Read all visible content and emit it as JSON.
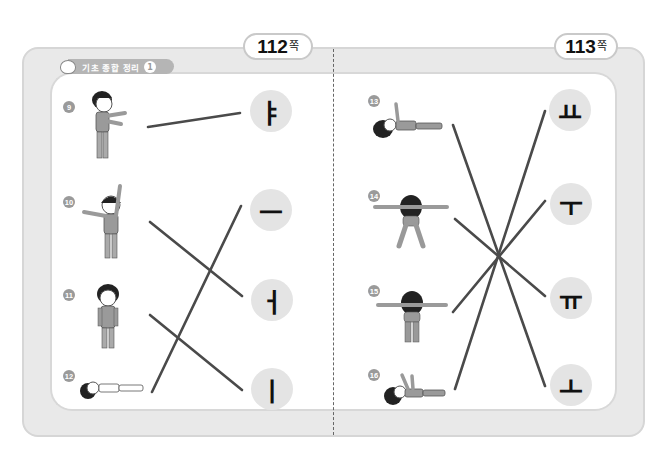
{
  "pages": {
    "left_page": "112",
    "right_page": "113",
    "unit": "쪽"
  },
  "section": {
    "title": "기초 종합 정리",
    "badge": "1"
  },
  "colors": {
    "frame": "#e9e9e9",
    "circle": "#e4e4e4",
    "line": "#4a4a4a",
    "qnum": "#9a9a9a"
  },
  "left": {
    "questions": [
      {
        "num": "9",
        "pose": "standing, both arms stretched forward"
      },
      {
        "num": "10",
        "pose": "standing, one arm up, one arm out to side"
      },
      {
        "num": "11",
        "pose": "standing straight, arms down"
      },
      {
        "num": "12",
        "pose": "lying flat on back"
      }
    ],
    "vowels": [
      "ㅑ",
      "ㅡ",
      "ㅓ",
      "ㅣ"
    ],
    "matches": [
      {
        "question": "9",
        "vowel": "ㅑ"
      },
      {
        "question": "10",
        "vowel": "ㅓ"
      },
      {
        "question": "11",
        "vowel": "ㅣ"
      },
      {
        "question": "12",
        "vowel": "ㅡ"
      }
    ]
  },
  "right": {
    "questions": [
      {
        "num": "13",
        "pose": "lying, one arm raised up"
      },
      {
        "num": "14",
        "pose": "back view, arms out, legs apart"
      },
      {
        "num": "15",
        "pose": "back view, arms out, legs together"
      },
      {
        "num": "16",
        "pose": "lying, both arms raised up"
      }
    ],
    "vowels": [
      "ㅛ",
      "ㅜ",
      "ㅠ",
      "ㅗ"
    ],
    "matches": [
      {
        "question": "13",
        "vowel": "ㅗ"
      },
      {
        "question": "14",
        "vowel": "ㅠ"
      },
      {
        "question": "15",
        "vowel": "ㅜ"
      },
      {
        "question": "16",
        "vowel": "ㅛ"
      }
    ]
  }
}
